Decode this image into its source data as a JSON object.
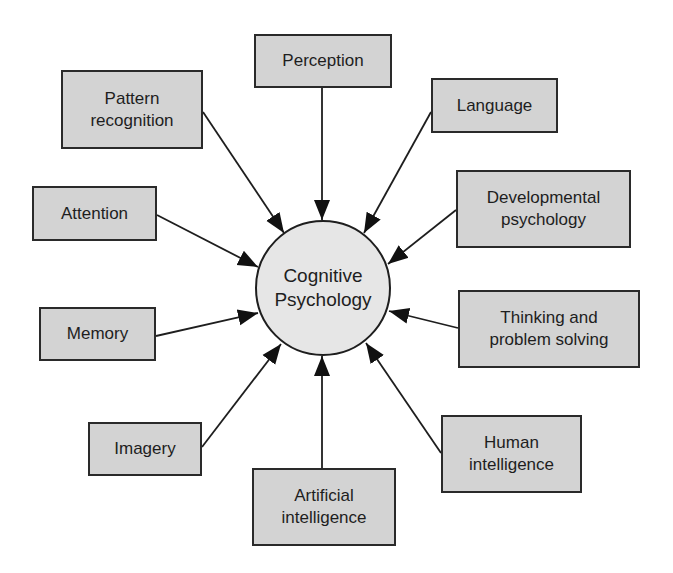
{
  "diagram": {
    "type": "hub-and-spoke concept map",
    "colors": {
      "box_fill": "#d3d3d3",
      "circle_fill": "#e6e6e6",
      "stroke": "#1e1e1e",
      "background": "#ffffff"
    },
    "center": {
      "line1": "Cognitive",
      "line2": "Psychology"
    },
    "nodes": {
      "perception": {
        "line1": "Perception"
      },
      "pattern_recognition": {
        "line1": "Pattern",
        "line2": "recognition"
      },
      "language": {
        "line1": "Language"
      },
      "attention": {
        "line1": "Attention"
      },
      "developmental_psychology": {
        "line1": "Developmental",
        "line2": "psychology"
      },
      "memory": {
        "line1": "Memory"
      },
      "thinking_problem_solving": {
        "line1": "Thinking and",
        "line2": "problem solving"
      },
      "imagery": {
        "line1": "Imagery"
      },
      "human_intelligence": {
        "line1": "Human",
        "line2": "intelligence"
      },
      "artificial_intelligence": {
        "line1": "Artificial",
        "line2": "intelligence"
      }
    },
    "edges": [
      {
        "from": "Perception",
        "to": "Cognitive Psychology"
      },
      {
        "from": "Pattern recognition",
        "to": "Cognitive Psychology"
      },
      {
        "from": "Language",
        "to": "Cognitive Psychology"
      },
      {
        "from": "Attention",
        "to": "Cognitive Psychology"
      },
      {
        "from": "Developmental psychology",
        "to": "Cognitive Psychology"
      },
      {
        "from": "Memory",
        "to": "Cognitive Psychology"
      },
      {
        "from": "Thinking and problem solving",
        "to": "Cognitive Psychology"
      },
      {
        "from": "Imagery",
        "to": "Cognitive Psychology"
      },
      {
        "from": "Human intelligence",
        "to": "Cognitive Psychology"
      },
      {
        "from": "Artificial intelligence",
        "to": "Cognitive Psychology"
      }
    ]
  }
}
